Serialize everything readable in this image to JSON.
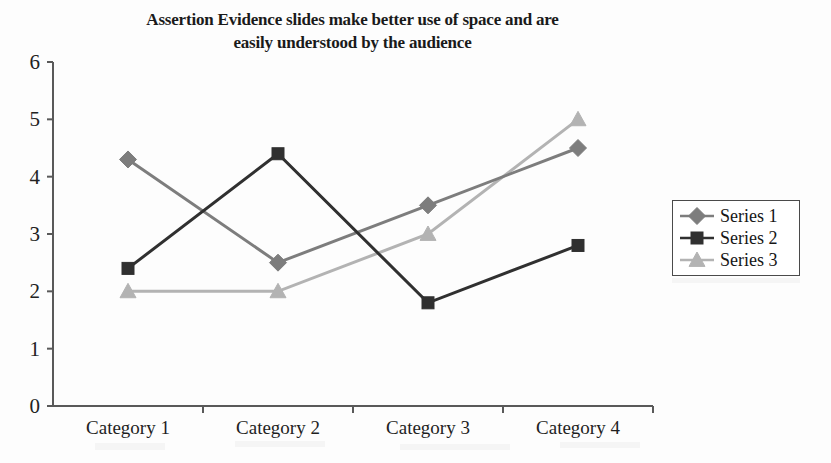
{
  "chart_data": {
    "type": "line",
    "title": "Assertion Evidence slides make better use of space and are easily understood by the audience",
    "title_line1": "Assertion Evidence slides make better use of space and are",
    "title_line2": "easily understood by the audience",
    "xlabel": "",
    "ylabel": "",
    "categories": [
      "Category 1",
      "Category 2",
      "Category 3",
      "Category 4"
    ],
    "ylim": [
      0,
      6
    ],
    "ytick_labels": [
      "0",
      "1",
      "2",
      "3",
      "4",
      "5",
      "6"
    ],
    "ytick_values": [
      0,
      1,
      2,
      3,
      4,
      5,
      6
    ],
    "grid": false,
    "legend_position": "right",
    "series": [
      {
        "name": "Series 1",
        "marker": "diamond",
        "color": "#7d7d7d",
        "values": [
          4.3,
          2.5,
          3.5,
          4.5
        ]
      },
      {
        "name": "Series 2",
        "marker": "square",
        "color": "#303030",
        "values": [
          2.4,
          4.4,
          1.8,
          2.8
        ]
      },
      {
        "name": "Series 3",
        "marker": "triangle",
        "color": "#b3b3b3",
        "values": [
          2.0,
          2.0,
          3.0,
          5.0
        ]
      }
    ]
  },
  "axes": {
    "axis_color": "#595959",
    "plot_left": 53,
    "plot_right": 653,
    "plot_top": 62,
    "plot_bottom": 406
  },
  "legend": {
    "entries": [
      "Series 1",
      "Series 2",
      "Series 3"
    ],
    "border_color": "#4a4a4a"
  }
}
